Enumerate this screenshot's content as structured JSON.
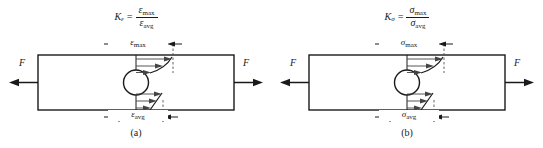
{
  "figure": {
    "panels": [
      {
        "id": "a",
        "caption": "(a)",
        "quantity_symbol": "ε",
        "factor_symbol": "K",
        "factor_subscript": "ε",
        "formula": {
          "lhs_symbol": "K",
          "lhs_subscript": "ε",
          "equals": "=",
          "numerator_symbol": "ε",
          "numerator_subscript": "max",
          "denominator_symbol": "ε",
          "denominator_subscript": "avg",
          "plain": "Kε = εmax / εavg"
        },
        "top_dimension_label": {
          "symbol": "ε",
          "subscript": "max",
          "plain": "εmax"
        },
        "bottom_dimension_label": {
          "symbol": "ε",
          "subscript": "avg",
          "plain": "εavg"
        },
        "force_left_label": "F",
        "force_right_label": "F",
        "top_profile_type": "concave-decaying",
        "bottom_profile_type": "linear-uniform"
      },
      {
        "id": "b",
        "caption": "(b)",
        "quantity_symbol": "σ",
        "factor_symbol": "K",
        "factor_subscript": "σ",
        "formula": {
          "lhs_symbol": "K",
          "lhs_subscript": "σ",
          "equals": "=",
          "numerator_symbol": "σ",
          "numerator_subscript": "max",
          "denominator_symbol": "σ",
          "denominator_subscript": "avg",
          "plain": "Kσ = σmax / σavg"
        },
        "top_dimension_label": {
          "symbol": "σ",
          "subscript": "max",
          "plain": "σmax"
        },
        "bottom_dimension_label": {
          "symbol": "σ",
          "subscript": "avg",
          "plain": "σavg"
        },
        "force_left_label": "F",
        "force_right_label": "F",
        "top_profile_type": "concave-decaying",
        "bottom_profile_type": "linear-uniform"
      }
    ],
    "colors": {
      "background": "#ffffff",
      "stroke": "#1a1a1a",
      "thin_stroke": "#444444",
      "dashed_stroke": "#555555"
    }
  }
}
